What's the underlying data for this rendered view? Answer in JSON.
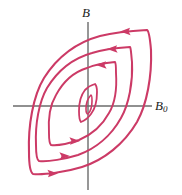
{
  "figure": {
    "type": "diagram",
    "background_color": "#ffffff"
  },
  "axes": {
    "vertical": {
      "label": "B",
      "name": "magnetic-field",
      "color": "#6b6b6b",
      "x": 88,
      "y_top": 22,
      "y_bottom": 190
    },
    "horizontal": {
      "label": "B",
      "label_subscript": "0",
      "name": "applied-field",
      "color": "#6b6b6b",
      "y": 106,
      "x_left": 13,
      "x_right": 152
    },
    "origin": {
      "x": 88,
      "y": 106
    }
  },
  "curves": {
    "color": "#cc3a66",
    "stroke_width": 2.0,
    "count": 4,
    "loops": [
      {
        "name": "loop-outermost",
        "index": 1,
        "amplitude": "largest"
      },
      {
        "name": "loop-second",
        "index": 2,
        "amplitude": "large"
      },
      {
        "name": "loop-third",
        "index": 3,
        "amplitude": "small"
      },
      {
        "name": "loop-innermost",
        "index": 4,
        "amplitude": "smallest"
      }
    ]
  },
  "arrows": {
    "color": "#cc3a66",
    "markers": [
      {
        "name": "arrow-top-outermost",
        "direction": "left",
        "x": 128,
        "y": 31
      },
      {
        "name": "arrow-top-second",
        "direction": "left",
        "x": 115,
        "y": 48
      },
      {
        "name": "arrow-top-third",
        "direction": "left",
        "x": 104,
        "y": 64
      },
      {
        "name": "arrow-bottom-outermost",
        "direction": "right",
        "x": 50,
        "y": 173
      },
      {
        "name": "arrow-bottom-second",
        "direction": "right",
        "x": 62,
        "y": 155
      },
      {
        "name": "arrow-bottom-third",
        "direction": "right",
        "x": 72,
        "y": 140
      }
    ]
  }
}
